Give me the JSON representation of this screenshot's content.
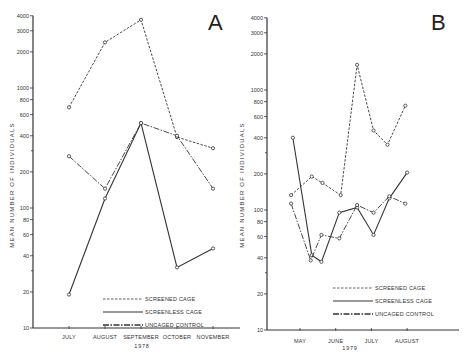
{
  "chart_data": [
    {
      "panel": "A",
      "type": "line",
      "title": "",
      "xlabel": "1978",
      "ylabel": "MEAN NUMBER OF INDIVIDUALS",
      "yscale": "log",
      "ylim": [
        10,
        4000
      ],
      "yticks": [
        10,
        20,
        40,
        60,
        80,
        100,
        200,
        400,
        600,
        800,
        1000,
        2000,
        3000,
        4000
      ],
      "categories": [
        "JULY",
        "AUGUST",
        "SEPTEMBER",
        "OCTOBER",
        "NOVEMBER"
      ],
      "grid": false,
      "legend_position": "lower-right",
      "series": [
        {
          "name": "SCREENED CAGE",
          "style": "dashed",
          "x": [
            0,
            1,
            2,
            3,
            4
          ],
          "values": [
            690,
            2400,
            3700,
            390,
            315
          ]
        },
        {
          "name": "SCREENLESS CAGE",
          "style": "solid",
          "x": [
            0,
            1,
            2,
            3,
            4
          ],
          "values": [
            19,
            120,
            510,
            32,
            46
          ]
        },
        {
          "name": "UNCAGED CONTROL",
          "style": "dash-dot",
          "x": [
            0,
            1,
            2,
            3,
            4
          ],
          "values": [
            270,
            145,
            510,
            400,
            145
          ]
        }
      ]
    },
    {
      "panel": "B",
      "type": "line",
      "title": "",
      "xlabel": "1979",
      "ylabel": "MEAN NUMBER OF INDIVIDUALS",
      "yscale": "log",
      "ylim": [
        10,
        4000
      ],
      "yticks": [
        10,
        20,
        40,
        60,
        80,
        100,
        200,
        400,
        600,
        800,
        1000,
        2000,
        3000,
        4000
      ],
      "categories": [
        "MAY",
        "JUNE",
        "JULY",
        "AUGUST"
      ],
      "grid": false,
      "legend_position": "lower-right",
      "series": [
        {
          "name": "SCREENED CAGE",
          "style": "dashed",
          "x": [
            -0.25,
            0.33,
            0.63,
            1.14,
            1.6,
            2.06,
            2.45,
            2.95
          ],
          "values": [
            133,
            190,
            168,
            133,
            1620,
            460,
            350,
            740
          ]
        },
        {
          "name": "SCREENLESS CAGE",
          "style": "solid",
          "x": [
            -0.2,
            0.33,
            0.6,
            1.1,
            1.6,
            2.06,
            2.5,
            3.0
          ],
          "values": [
            400,
            42,
            37,
            95,
            105,
            62,
            125,
            205
          ]
        },
        {
          "name": "UNCAGED CONTROL",
          "style": "dash-dot",
          "x": [
            -0.25,
            0.3,
            0.6,
            1.1,
            1.6,
            2.06,
            2.5,
            2.95
          ],
          "values": [
            113,
            38,
            62,
            58,
            110,
            95,
            130,
            113
          ]
        }
      ]
    }
  ],
  "panels": {
    "A": {
      "letter": "A",
      "year": "1978",
      "ylabel": "MEAN NUMBER OF INDIVIDUALS",
      "months": [
        "JULY",
        "AUGUST",
        "SEPTEMBER",
        "OCTOBER",
        "NOVEMBER"
      ],
      "legend": [
        "SCREENED CAGE",
        "SCREENLESS CAGE",
        "UNCAGED CONTROL"
      ]
    },
    "B": {
      "letter": "B",
      "year": "1979",
      "ylabel": "MEAN NUMBER OF INDIVIDUALS",
      "months": [
        "MAY",
        "JUNE",
        "JULY",
        "AUGUST"
      ],
      "legend": [
        "SCREENED CAGE",
        "SCREENLESS CAGE",
        "UNCAGED CONTROL"
      ]
    }
  },
  "ytick_labels": [
    "10",
    "20",
    "40",
    "60",
    "80",
    "100",
    "200",
    "400",
    "600",
    "800",
    "1000",
    "2000",
    "3000",
    "4000"
  ],
  "colors": {
    "ink": "#333333",
    "background": "#ffffff"
  }
}
